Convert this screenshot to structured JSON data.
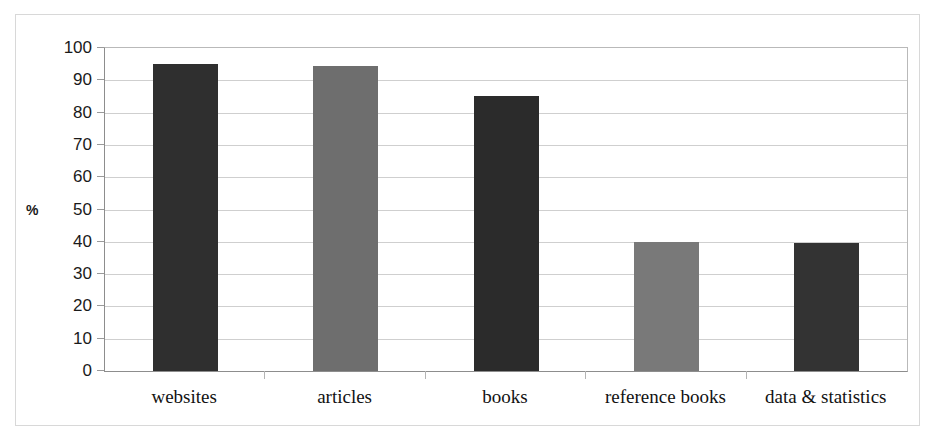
{
  "chart_data": {
    "type": "bar",
    "title": "",
    "xlabel": "",
    "ylabel": "%",
    "categories": [
      "websites",
      "articles",
      "books",
      "reference books",
      "data & statistics"
    ],
    "values": [
      95,
      94.5,
      85,
      40,
      39.5
    ],
    "series": [
      {
        "name": "",
        "values": [
          95,
          94.5,
          85,
          40,
          39.5
        ],
        "colors": [
          "#2f2f2f",
          "#6e6e6e",
          "#2b2b2b",
          "#797979",
          "#333333"
        ]
      }
    ],
    "ylim": [
      0,
      100
    ],
    "ytick_labels": [
      "100",
      "90",
      "80",
      "70",
      "60",
      "50",
      "40",
      "30",
      "20",
      "10",
      "0"
    ],
    "ytick_values": [
      100,
      90,
      80,
      70,
      60,
      50,
      40,
      30,
      20,
      10,
      0
    ],
    "grid": true,
    "legend": "none",
    "gridline_color": "#cfcfcf",
    "axis_color": "#8d8d8d",
    "frame_color": "#d8d8d8",
    "background": "#ffffff"
  }
}
